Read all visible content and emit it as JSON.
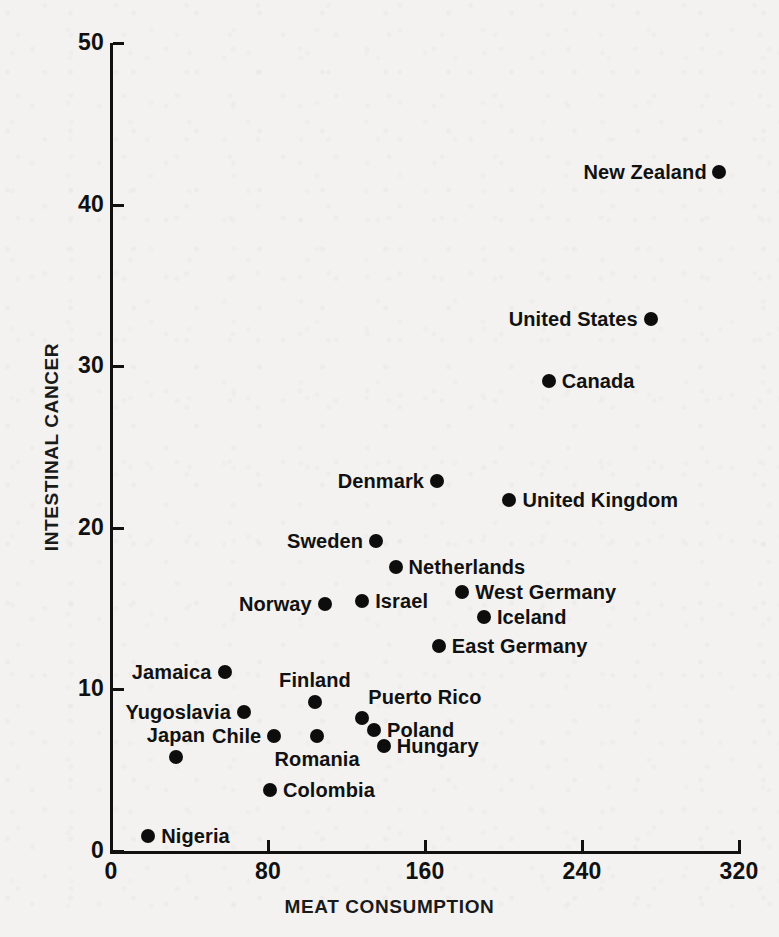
{
  "chart_data": {
    "type": "scatter",
    "title": "",
    "xlabel": "MEAT CONSUMPTION",
    "ylabel": "INTESTINAL CANCER",
    "xlim": [
      0,
      320
    ],
    "ylim": [
      0,
      50
    ],
    "xticks": [
      "0",
      "80",
      "160",
      "240",
      "320"
    ],
    "xtick_values": [
      0,
      80,
      160,
      240,
      320
    ],
    "yticks": [
      "0",
      "10",
      "20",
      "30",
      "40",
      "50"
    ],
    "ytick_values": [
      0,
      10,
      20,
      30,
      40,
      50
    ],
    "grid": false,
    "legend": "none",
    "points": [
      {
        "label": "New Zealand",
        "x": 310,
        "y": 42.0,
        "side": "left"
      },
      {
        "label": "United States",
        "x": 275,
        "y": 32.9,
        "side": "left"
      },
      {
        "label": "Canada",
        "x": 223,
        "y": 29.1,
        "side": "right"
      },
      {
        "label": "Denmark",
        "x": 166,
        "y": 22.9,
        "side": "left"
      },
      {
        "label": "United Kingdom",
        "x": 203,
        "y": 21.7,
        "side": "right"
      },
      {
        "label": "Sweden",
        "x": 135,
        "y": 19.2,
        "side": "left"
      },
      {
        "label": "Netherlands",
        "x": 145,
        "y": 17.6,
        "side": "right"
      },
      {
        "label": "West Germany",
        "x": 179,
        "y": 16.0,
        "side": "right"
      },
      {
        "label": "Israel",
        "x": 128,
        "y": 15.5,
        "side": "right"
      },
      {
        "label": "Norway",
        "x": 109,
        "y": 15.3,
        "side": "left"
      },
      {
        "label": "Iceland",
        "x": 190,
        "y": 14.5,
        "side": "right"
      },
      {
        "label": "East Germany",
        "x": 167,
        "y": 12.7,
        "side": "right"
      },
      {
        "label": "Jamaica",
        "x": 58,
        "y": 11.1,
        "side": "left"
      },
      {
        "label": "Finland",
        "x": 104,
        "y": 9.2,
        "side": "above"
      },
      {
        "label": "Yugoslavia",
        "x": 68,
        "y": 8.6,
        "side": "left"
      },
      {
        "label": "Puerto Rico",
        "x": 128,
        "y": 8.2,
        "side": "above-right"
      },
      {
        "label": "Poland",
        "x": 134,
        "y": 7.5,
        "side": "right"
      },
      {
        "label": "Chile",
        "x": 83,
        "y": 7.1,
        "side": "left"
      },
      {
        "label": "Romania",
        "x": 105,
        "y": 7.1,
        "side": "below"
      },
      {
        "label": "Hungary",
        "x": 139,
        "y": 6.5,
        "side": "right"
      },
      {
        "label": "Japan",
        "x": 33,
        "y": 5.8,
        "side": "above"
      },
      {
        "label": "Colombia",
        "x": 81,
        "y": 3.8,
        "side": "right"
      },
      {
        "label": "Nigeria",
        "x": 19,
        "y": 0.9,
        "side": "right"
      }
    ],
    "colors": {
      "marker": "#0d0d0d",
      "axis": "#111111",
      "text": "#111111",
      "background": "#f3f2f0"
    }
  },
  "axes": {
    "x_title": "MEAT CONSUMPTION",
    "y_title": "INTESTINAL CANCER"
  }
}
